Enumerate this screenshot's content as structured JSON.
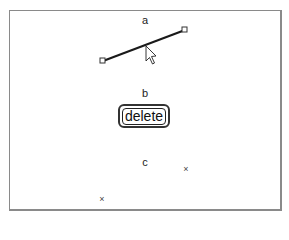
{
  "panels": {
    "a": {
      "label": "a"
    },
    "b": {
      "label": "b",
      "button_label": "delete"
    },
    "c": {
      "label": "c",
      "marker_glyph": "×"
    }
  },
  "colors": {
    "line": "#1a1a1a",
    "frame": "#8a8a8a",
    "handle": "#ffffff"
  }
}
